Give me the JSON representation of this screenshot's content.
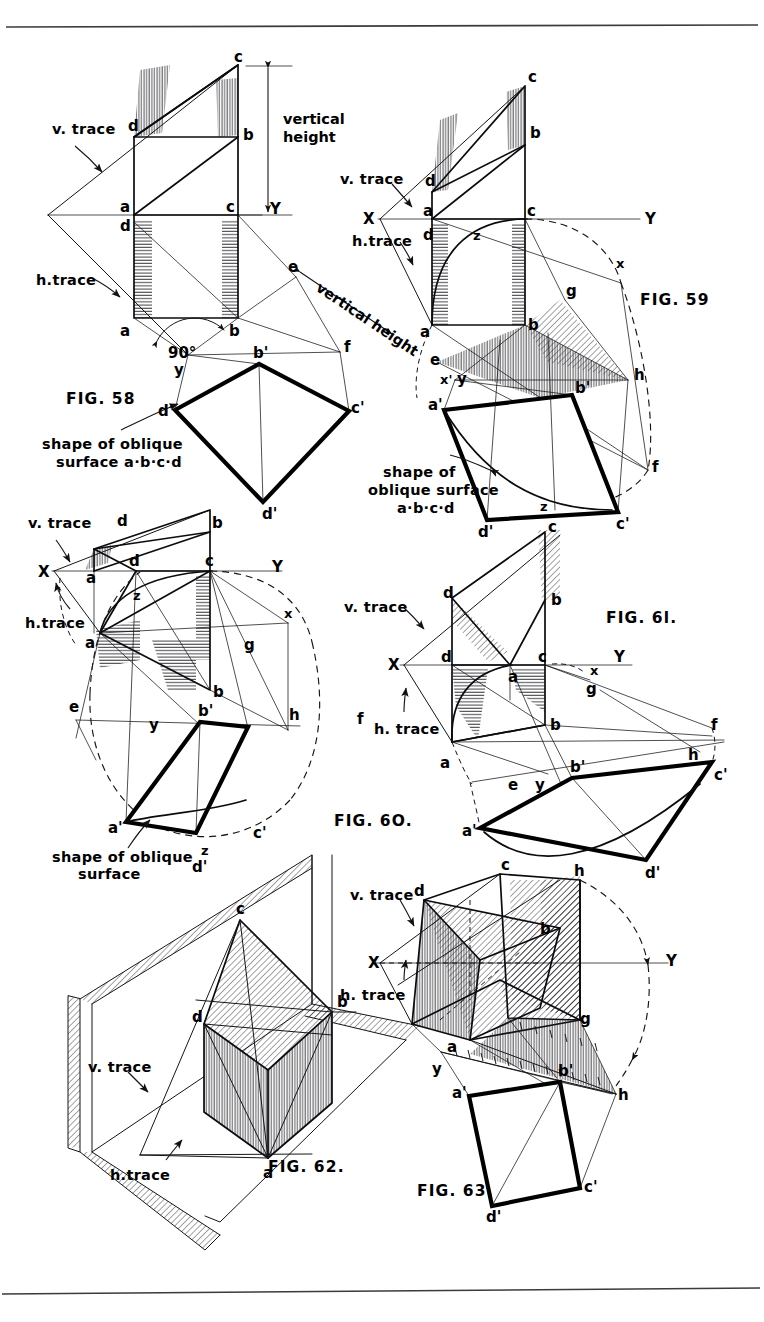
{
  "page": {
    "kind": "engineering-drawing-plate",
    "background": "#ffffff",
    "ink": "#000000",
    "top_rule": true,
    "bottom_rule": true
  },
  "figures": [
    {
      "id": "fig58",
      "label": "FIG. 58",
      "notes": [
        {
          "key": "v_trace",
          "text": "v. trace"
        },
        {
          "key": "h_trace",
          "text": "h.trace"
        },
        {
          "key": "vertical_height",
          "text": "vertical height"
        },
        {
          "key": "angle",
          "text": "90°"
        },
        {
          "key": "shape_l1",
          "text": "shape of oblique"
        },
        {
          "key": "shape_l2",
          "text": "surface  a·b·c·d"
        }
      ],
      "axis": {
        "y": "Y"
      },
      "points": [
        "c",
        "d",
        "b",
        "a",
        "c",
        "d",
        "a",
        "b",
        "y",
        "b'",
        "c'",
        "d'",
        "a'",
        "e",
        "f"
      ]
    },
    {
      "id": "fig59",
      "label": "FIG. 59",
      "notes": [
        {
          "key": "v_trace",
          "text": "v. trace"
        },
        {
          "key": "h_trace",
          "text": "h.trace"
        },
        {
          "key": "shape_l1",
          "text": "shape of"
        },
        {
          "key": "shape_l2",
          "text": "oblique surface"
        },
        {
          "key": "shape_l3",
          "text": "a·b·c·d"
        }
      ],
      "axis": {
        "x": "X",
        "y": "Y",
        "x2": "x",
        "x3": "x'"
      },
      "points": [
        "c",
        "b",
        "d",
        "a",
        "c",
        "d",
        "z",
        "a",
        "b",
        "g",
        "h",
        "f",
        "e",
        "y",
        "a'",
        "b'",
        "c'",
        "d'",
        "z"
      ]
    },
    {
      "id": "fig60",
      "label": "FIG. 60.",
      "notes": [
        {
          "key": "v_trace",
          "text": "v. trace"
        },
        {
          "key": "h_trace",
          "text": "h.trace"
        },
        {
          "key": "shape_l1",
          "text": "shape of oblique"
        },
        {
          "key": "shape_l2",
          "text": "surface"
        }
      ],
      "axis": {
        "x": "X",
        "y": "Y",
        "x2": "x"
      },
      "points": [
        "d",
        "b",
        "c",
        "a",
        "d",
        "z",
        "a",
        "b",
        "g",
        "e",
        "y",
        "b'",
        "h",
        "f",
        "a'",
        "c'",
        "d'",
        "z"
      ]
    },
    {
      "id": "fig61",
      "label": "FIG. 61.",
      "notes": [
        {
          "key": "v_trace",
          "text": "v. trace"
        },
        {
          "key": "h_trace",
          "text": "h. trace"
        }
      ],
      "axis": {
        "x": "X",
        "y": "Y",
        "x2": "x"
      },
      "points": [
        "c",
        "d",
        "b",
        "d",
        "a",
        "c",
        "g",
        "b",
        "a",
        "f",
        "h",
        "b'",
        "c'",
        "e",
        "y",
        "a'",
        "d'"
      ]
    },
    {
      "id": "fig62",
      "label": "FIG. 62.",
      "notes": [
        {
          "key": "v_trace",
          "text": "v. trace"
        },
        {
          "key": "h_trace",
          "text": "h. trace"
        }
      ],
      "points": [
        "c",
        "b",
        "d",
        "a"
      ]
    },
    {
      "id": "fig63",
      "label": "FIG. 63.",
      "notes": [
        {
          "key": "v_trace",
          "text": "v. trace"
        },
        {
          "key": "h_trace",
          "text": "h. trace"
        }
      ],
      "axis": {
        "x": "X",
        "y": "Y"
      },
      "points": [
        "c",
        "d",
        "h",
        "b",
        "a",
        "g",
        "y",
        "b'",
        "h",
        "a'",
        "d'",
        "c'"
      ]
    }
  ],
  "labels": {
    "fig58": {
      "v_trace": "v. trace",
      "h_trace": "h.trace",
      "vertical_height_1": "vertical",
      "vertical_height_2": "height",
      "vertical_height_rot": "vertical height",
      "angle": "90°",
      "shape_1": "shape of oblique",
      "shape_2": "surface  a·b·c·d",
      "fig": "FIG.  58",
      "Y": "Y",
      "c_top": "c",
      "d_top": "d",
      "b_top": "b",
      "a_mid": "a",
      "c_mid": "c",
      "d_mid2": "d",
      "a_bot": "a",
      "b_bot": "b",
      "y": "y",
      "e": "e",
      "f": "f",
      "bp": "b'",
      "cp": "c'",
      "dp": "d'",
      "ap": "d'"
    },
    "fig59": {
      "v_trace": "v. trace",
      "h_trace": "h.trace",
      "fig": "FIG. 59",
      "X": "X",
      "Y": "Y",
      "x2": "x",
      "x3": "x'",
      "shape_1": "shape of",
      "shape_2": "oblique surface",
      "shape_3": "a·b·c·d",
      "c": "c",
      "b": "b",
      "d": "d",
      "a1": "a",
      "c1": "c",
      "d1": "d",
      "z1": "z",
      "a2": "a",
      "b2": "b",
      "g": "g",
      "h": "h",
      "f": "f",
      "e": "e",
      "y": "y",
      "ap": "a'",
      "bp": "b'",
      "cp": "c'",
      "dp": "d'",
      "z2": "z"
    },
    "fig60": {
      "v_trace": "v. trace",
      "h_trace": "h.trace",
      "fig": "FIG. 6O.",
      "X": "X",
      "Y": "Y",
      "x2": "x",
      "shape_1": "shape of oblique",
      "shape_2": "surface",
      "d_top": "d",
      "b_top": "b",
      "a1": "a",
      "d1": "d",
      "c1": "c",
      "z1": "z",
      "a2": "a",
      "b2": "b",
      "g": "g",
      "e": "e",
      "y": "y",
      "h": "h",
      "f": "f",
      "bp": "b'",
      "ap": "a'",
      "cp": "c'",
      "dp": "d'",
      "z2": "z"
    },
    "fig61": {
      "v_trace": "v. trace",
      "h_trace": "h. trace",
      "fig": "FIG. 6l.",
      "X": "X",
      "Y": "Y",
      "x2": "x",
      "c": "c",
      "d_top": "d",
      "b_top": "b",
      "d1": "d",
      "a1": "a",
      "c1": "c",
      "g": "g",
      "b2": "b",
      "a2": "a",
      "f": "f",
      "h": "h",
      "bp": "b'",
      "cp": "c'",
      "e": "e",
      "y": "y",
      "ap": "a'",
      "dp": "d'"
    },
    "fig62": {
      "v_trace_1": "v. trace",
      "h_trace_1": "h.trace",
      "fig": "FIG. 62.",
      "c": "c",
      "b": "b",
      "d": "d",
      "a": "a"
    },
    "fig63": {
      "v_trace": "v. trace",
      "h_trace": "h. trace",
      "fig": "FIG. 63.",
      "X": "X",
      "Y": "Y",
      "c": "c",
      "d": "d",
      "h_top": "h",
      "b": "b",
      "a": "a",
      "g": "g",
      "y": "y",
      "bp": "b'",
      "h2": "h",
      "ap": "a'",
      "dp": "d'",
      "cp": "c'"
    }
  }
}
